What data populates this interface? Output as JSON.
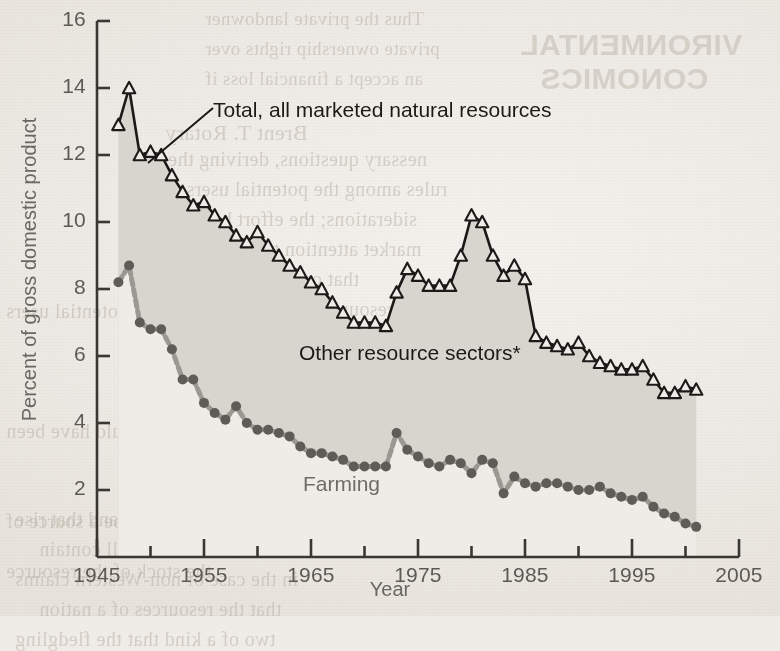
{
  "figure": {
    "background_color": "#efece7",
    "ink_color": "#1c1a18",
    "band_fill_color": "#d8d5cf",
    "farming_color": "#5f5c57",
    "axis_color": "#3a3733"
  },
  "axis_titles": {
    "y": "Percent of gross domestic product",
    "x": "Year"
  },
  "annotations": {
    "total_label": "Total, all marketed natural resources",
    "band_label": "Other resource sectors*",
    "farming_label": "Farming"
  },
  "bleed_text": {
    "header_line1": "VIRONMENTAL",
    "header_line2": "CONOMICS",
    "lines": [
      "Thus the private landowner",
      "private ownership rights over",
      "an accept a financial loss if",
      "Brent T. Rotary",
      "nessary questions, deriving the",
      "rules among the potential users",
      "siderations; the effort by a local",
      "market attention to the natural",
      "that could have been",
      "al resources the local managing",
      "are often in a position to",
      "sources that might be a source of",
      "substantial economic gain.",
      "the stock of the resource",
      "Trading in these rights allows the",
      "to the site can be sold for gain",
      "the resource rise, and that rise",
      "that the market will contain",
      "in the case of non-Western claims",
      "that the resources of a nation",
      "two of a kind that the fledgling"
    ]
  },
  "chart_data": {
    "type": "area",
    "title": "",
    "xlabel": "Year",
    "ylabel": "Percent of gross domestic product",
    "xlim": [
      1945,
      2005
    ],
    "ylim": [
      0,
      16
    ],
    "yticks": [
      2,
      4,
      6,
      8,
      10,
      12,
      14,
      16
    ],
    "xticks": [
      1945,
      1955,
      1965,
      1975,
      1985,
      1995,
      2005
    ],
    "xminorticks": [
      1950,
      1960,
      1970,
      1980,
      1990,
      2000
    ],
    "grid": false,
    "legend": "inline-annotations",
    "footnote_marker": "*",
    "x": [
      1947,
      1948,
      1949,
      1950,
      1951,
      1952,
      1953,
      1954,
      1955,
      1956,
      1957,
      1958,
      1959,
      1960,
      1961,
      1962,
      1963,
      1964,
      1965,
      1966,
      1967,
      1968,
      1969,
      1970,
      1971,
      1972,
      1973,
      1974,
      1975,
      1976,
      1977,
      1978,
      1979,
      1980,
      1981,
      1982,
      1983,
      1984,
      1985,
      1986,
      1987,
      1988,
      1989,
      1990,
      1991,
      1992,
      1993,
      1994,
      1995,
      1996,
      1997,
      1998,
      1999,
      2000,
      2001
    ],
    "series": [
      {
        "name": "Total, all marketed natural resources",
        "marker": "open-triangle",
        "line": "solid-black",
        "values": [
          12.9,
          14.0,
          12.0,
          12.1,
          12.0,
          11.4,
          10.9,
          10.5,
          10.6,
          10.2,
          10.0,
          9.6,
          9.4,
          9.7,
          9.3,
          9.0,
          8.7,
          8.5,
          8.2,
          8.0,
          7.6,
          7.3,
          7.0,
          7.0,
          7.0,
          6.9,
          7.9,
          8.6,
          8.4,
          8.1,
          8.1,
          8.1,
          9.0,
          10.2,
          10.0,
          9.0,
          8.4,
          8.7,
          8.3,
          6.6,
          6.4,
          6.3,
          6.2,
          6.4,
          6.0,
          5.8,
          5.7,
          5.6,
          5.6,
          5.7,
          5.3,
          4.9,
          4.9,
          5.1,
          5.0
        ]
      },
      {
        "name": "Farming",
        "marker": "filled-circle",
        "line": "dashed-grey",
        "values": [
          8.2,
          8.7,
          7.0,
          6.8,
          6.8,
          6.2,
          5.3,
          5.3,
          4.6,
          4.3,
          4.1,
          4.5,
          4.0,
          3.8,
          3.8,
          3.7,
          3.6,
          3.3,
          3.1,
          3.1,
          3.0,
          2.9,
          2.7,
          2.7,
          2.7,
          2.7,
          3.7,
          3.2,
          3.0,
          2.8,
          2.7,
          2.9,
          2.8,
          2.5,
          2.9,
          2.8,
          1.9,
          2.4,
          2.2,
          2.1,
          2.2,
          2.2,
          2.1,
          2.0,
          2.0,
          2.1,
          1.9,
          1.8,
          1.7,
          1.8,
          1.5,
          1.3,
          1.2,
          1.0,
          0.9
        ]
      }
    ]
  }
}
